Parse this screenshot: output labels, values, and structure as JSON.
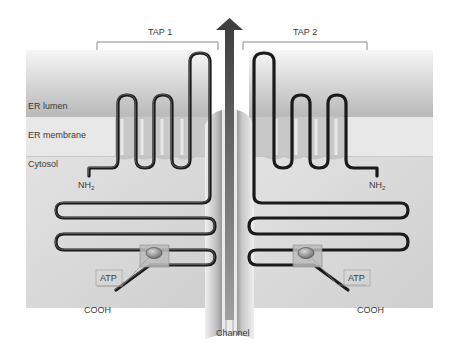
{
  "diagram": {
    "subunits": [
      {
        "label": "TAP 1",
        "n_terminus": "NH",
        "n_terminus_sub": "2",
        "c_terminus": "COOH",
        "atp_label": "ATP"
      },
      {
        "label": "TAP 2",
        "n_terminus": "NH",
        "n_terminus_sub": "2",
        "c_terminus": "COOH",
        "atp_label": "ATP"
      }
    ],
    "regions": {
      "lumen": "ER lumen",
      "membrane": "ER membrane",
      "cytosol": "Cytosol"
    },
    "channel_label": "Channel",
    "colors": {
      "chain": "#1a1a1a",
      "lumen_top": "#f4f4f4",
      "lumen_bottom": "#b9b9b9",
      "membrane": "#e6e6e6",
      "cytosol": "#d8d8d8",
      "arrow": "#5a5a5a",
      "atp_node": "#8c8c8c"
    }
  }
}
